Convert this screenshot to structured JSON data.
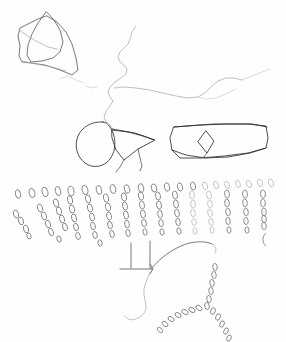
{
  "page": {
    "title": "Hand-drawn pencil sketch",
    "width": 286,
    "height": 342,
    "background_color": "#fefefe",
    "medium": "graphite pencil on white paper"
  },
  "palette": {
    "ink_dark": "#2f2f35",
    "ink_mid": "#565660",
    "ink_faint": "#a8a8b2",
    "ink_very_faint": "#c9c9d2",
    "mark_ring": "#6b6b76",
    "paper": "#fefefe"
  },
  "elements": {
    "polygon_cluster": {
      "name": "overlapping angular polygons",
      "region": "top-left",
      "tone": "ink_mid",
      "count": 2
    },
    "wavy_contour": {
      "name": "long meandering contour line",
      "region": "top-center to right",
      "tone": "ink_faint"
    },
    "short_contour": {
      "name": "short broken contour segment",
      "region": "upper-left-center",
      "tone": "ink_very_faint"
    },
    "oval_shape": {
      "name": "large oval outline",
      "region": "center-left",
      "tone": "ink_dark"
    },
    "triangle_flap": {
      "name": "triangular flap abutting oval",
      "region": "center",
      "tone": "ink_dark"
    },
    "band_quad": {
      "name": "wide elongated quadrilateral band",
      "region": "center-right",
      "tone": "ink_dark"
    },
    "inner_diamond": {
      "name": "small diamond inside band",
      "region": "center of band",
      "tone": "ink_dark"
    },
    "mark_field_upper": {
      "name": "top row of oval loop marks",
      "region": "middle band, full width",
      "tone": "mark_ring"
    },
    "mark_field_diagonals": {
      "name": "diagonal streaks of oval loop marks",
      "region": "middle band",
      "tone": "mark_ring"
    },
    "corner_lines": {
      "name": "vertical and horizontal ruled lines meeting at a junction",
      "region": "lower-center",
      "tone": "ink_mid"
    },
    "sweeping_arc": {
      "name": "arc sweeping up and right from junction",
      "region": "lower-center-right",
      "tone": "ink_mid"
    },
    "tail_squiggle": {
      "name": "wavy tail descending from junction",
      "region": "lower-center",
      "tone": "ink_faint"
    },
    "y_mark_branch": {
      "name": "Y-shaped branching trail of oval marks",
      "region": "lower-right",
      "tone": "mark_ring"
    }
  }
}
